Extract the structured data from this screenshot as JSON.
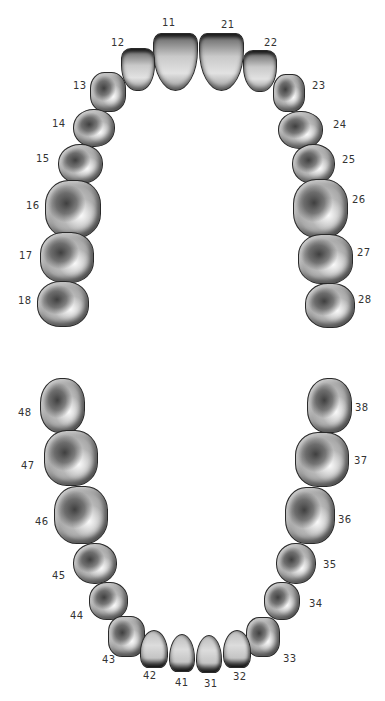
{
  "diagram": {
    "colors": {
      "background": "#ffffff",
      "tooth_outline": "#2a2a2a",
      "label": "#333333"
    },
    "upper_arch": {
      "teeth": [
        {
          "id": "11",
          "label": "11",
          "type": "incisor",
          "x": 153,
          "y": 33,
          "w": 45,
          "h": 58,
          "r": "8px 8px 50% 50% / 10px 10px 70% 70%",
          "lx": 162,
          "ly": 18
        },
        {
          "id": "21",
          "label": "21",
          "type": "incisor",
          "x": 199,
          "y": 33,
          "w": 45,
          "h": 58,
          "r": "8px 8px 50% 50% / 10px 10px 70% 70%",
          "lx": 221,
          "ly": 20
        },
        {
          "id": "12",
          "label": "12",
          "type": "incisor",
          "x": 121,
          "y": 48,
          "w": 34,
          "h": 43,
          "r": "10px 10px 45% 45% / 10px 10px 60% 60%",
          "lx": 111,
          "ly": 38
        },
        {
          "id": "22",
          "label": "22",
          "type": "incisor",
          "x": 243,
          "y": 50,
          "w": 34,
          "h": 42,
          "r": "10px 10px 45% 45% / 10px 10px 60% 60%",
          "lx": 264,
          "ly": 38
        },
        {
          "id": "13",
          "label": "13",
          "type": "molar",
          "x": 90,
          "y": 72,
          "w": 36,
          "h": 40,
          "r": "40%",
          "lx": 73,
          "ly": 81
        },
        {
          "id": "23",
          "label": "23",
          "type": "molar",
          "x": 273,
          "y": 74,
          "w": 32,
          "h": 38,
          "r": "40%",
          "lx": 312,
          "ly": 81
        },
        {
          "id": "14",
          "label": "14",
          "type": "molar",
          "x": 73,
          "y": 109,
          "w": 42,
          "h": 38,
          "r": "48%",
          "lx": 52,
          "ly": 119
        },
        {
          "id": "24",
          "label": "24",
          "type": "molar",
          "x": 278,
          "y": 111,
          "w": 45,
          "h": 38,
          "r": "48%",
          "lx": 333,
          "ly": 120
        },
        {
          "id": "15",
          "label": "15",
          "type": "molar",
          "x": 58,
          "y": 144,
          "w": 45,
          "h": 40,
          "r": "48%",
          "lx": 36,
          "ly": 154
        },
        {
          "id": "25",
          "label": "25",
          "type": "molar",
          "x": 292,
          "y": 144,
          "w": 43,
          "h": 40,
          "r": "48%",
          "lx": 342,
          "ly": 155
        },
        {
          "id": "16",
          "label": "16",
          "type": "molar",
          "x": 45,
          "y": 180,
          "w": 56,
          "h": 58,
          "r": "42%",
          "lx": 26,
          "ly": 201
        },
        {
          "id": "26",
          "label": "26",
          "type": "molar",
          "x": 293,
          "y": 179,
          "w": 55,
          "h": 59,
          "r": "42%",
          "lx": 352,
          "ly": 195
        },
        {
          "id": "17",
          "label": "17",
          "type": "molar",
          "x": 40,
          "y": 232,
          "w": 54,
          "h": 51,
          "r": "42%",
          "lx": 19,
          "ly": 251
        },
        {
          "id": "27",
          "label": "27",
          "type": "molar",
          "x": 298,
          "y": 234,
          "w": 55,
          "h": 50,
          "r": "42%",
          "lx": 357,
          "ly": 248
        },
        {
          "id": "18",
          "label": "18",
          "type": "molar",
          "x": 37,
          "y": 281,
          "w": 52,
          "h": 46,
          "r": "45%",
          "lx": 18,
          "ly": 296
        },
        {
          "id": "28",
          "label": "28",
          "type": "molar",
          "x": 305,
          "y": 283,
          "w": 50,
          "h": 45,
          "r": "45%",
          "lx": 358,
          "ly": 295
        }
      ]
    },
    "lower_arch": {
      "teeth": [
        {
          "id": "48",
          "label": "48",
          "type": "molar",
          "x": 40,
          "y": 378,
          "w": 45,
          "h": 55,
          "r": "45% 45% 42% 42%",
          "lx": 18,
          "ly": 408
        },
        {
          "id": "38",
          "label": "38",
          "type": "molar",
          "x": 307,
          "y": 378,
          "w": 45,
          "h": 55,
          "r": "45% 45% 42% 42%",
          "lx": 355,
          "ly": 403
        },
        {
          "id": "47",
          "label": "47",
          "type": "molar",
          "x": 44,
          "y": 430,
          "w": 54,
          "h": 56,
          "r": "42%",
          "lx": 21,
          "ly": 461
        },
        {
          "id": "37",
          "label": "37",
          "type": "molar",
          "x": 295,
          "y": 432,
          "w": 54,
          "h": 55,
          "r": "42%",
          "lx": 354,
          "ly": 456
        },
        {
          "id": "46",
          "label": "46",
          "type": "molar",
          "x": 54,
          "y": 486,
          "w": 54,
          "h": 58,
          "r": "42%",
          "lx": 35,
          "ly": 517
        },
        {
          "id": "36",
          "label": "36",
          "type": "molar",
          "x": 285,
          "y": 487,
          "w": 50,
          "h": 57,
          "r": "42%",
          "lx": 338,
          "ly": 515
        },
        {
          "id": "45",
          "label": "45",
          "type": "molar",
          "x": 73,
          "y": 543,
          "w": 44,
          "h": 41,
          "r": "48%",
          "lx": 52,
          "ly": 571
        },
        {
          "id": "35",
          "label": "35",
          "type": "molar",
          "x": 276,
          "y": 543,
          "w": 40,
          "h": 41,
          "r": "48%",
          "lx": 323,
          "ly": 560
        },
        {
          "id": "44",
          "label": "44",
          "type": "molar",
          "x": 89,
          "y": 582,
          "w": 39,
          "h": 38,
          "r": "45%",
          "lx": 70,
          "ly": 611
        },
        {
          "id": "34",
          "label": "34",
          "type": "molar",
          "x": 264,
          "y": 582,
          "w": 36,
          "h": 38,
          "r": "45%",
          "lx": 309,
          "ly": 599
        },
        {
          "id": "43",
          "label": "43",
          "type": "molar",
          "x": 108,
          "y": 616,
          "w": 37,
          "h": 41,
          "r": "38%",
          "lx": 102,
          "ly": 655
        },
        {
          "id": "33",
          "label": "33",
          "type": "molar",
          "x": 246,
          "y": 617,
          "w": 34,
          "h": 40,
          "r": "38%",
          "lx": 283,
          "ly": 654
        },
        {
          "id": "42",
          "label": "42",
          "type": "lincisor",
          "x": 140,
          "y": 630,
          "w": 28,
          "h": 38,
          "r": "50% 50% 30% 30% / 60% 60% 30% 30%",
          "lx": 143,
          "ly": 671
        },
        {
          "id": "32",
          "label": "32",
          "type": "lincisor",
          "x": 223,
          "y": 630,
          "w": 28,
          "h": 38,
          "r": "50% 50% 30% 30% / 60% 60% 30% 30%",
          "lx": 233,
          "ly": 672
        },
        {
          "id": "41",
          "label": "41",
          "type": "lincisor",
          "x": 169,
          "y": 634,
          "w": 26,
          "h": 38,
          "r": "50% 50% 30% 30% / 65% 65% 30% 30%",
          "lx": 175,
          "ly": 678
        },
        {
          "id": "31",
          "label": "31",
          "type": "lincisor",
          "x": 196,
          "y": 635,
          "w": 26,
          "h": 38,
          "r": "50% 50% 30% 30% / 65% 65% 30% 30%",
          "lx": 204,
          "ly": 679
        }
      ]
    }
  }
}
